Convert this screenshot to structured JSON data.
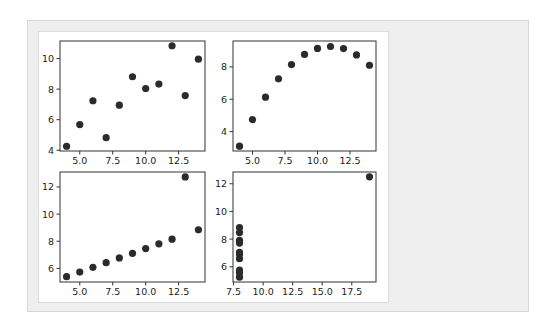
{
  "figure": {
    "layout": "2x2 grid of scatter plots",
    "marker_color": "#2b2b2b",
    "frame_color": "#333333",
    "panel_bg": "#efefef"
  },
  "chart_data": [
    {
      "type": "scatter",
      "title": "",
      "xlabel": "",
      "ylabel": "",
      "x": [
        10,
        8,
        13,
        9,
        11,
        14,
        6,
        4,
        12,
        7,
        5
      ],
      "y": [
        8.04,
        6.95,
        7.58,
        8.81,
        8.33,
        9.96,
        7.24,
        4.26,
        10.84,
        4.82,
        5.68
      ],
      "xlim": [
        3.5,
        14.5
      ],
      "ylim": [
        3.95,
        11.15
      ],
      "xticks": [
        5.0,
        7.5,
        10.0,
        12.5
      ],
      "xtick_labels": [
        "5.0",
        "7.5",
        "10.0",
        "12.5"
      ],
      "yticks": [
        4,
        6,
        8,
        10
      ],
      "ytick_labels": [
        "4",
        "6",
        "8",
        "10"
      ],
      "grid": false,
      "box": {
        "left": 60,
        "top": 41,
        "right": 205,
        "bottom": 151
      }
    },
    {
      "type": "scatter",
      "title": "",
      "xlabel": "",
      "ylabel": "",
      "x": [
        10,
        8,
        13,
        9,
        11,
        14,
        6,
        4,
        12,
        7,
        5
      ],
      "y": [
        9.14,
        8.14,
        8.74,
        8.77,
        9.26,
        8.1,
        6.13,
        3.1,
        9.13,
        7.26,
        4.74
      ],
      "xlim": [
        3.5,
        14.5
      ],
      "ylim": [
        2.8,
        9.6
      ],
      "xticks": [
        5.0,
        7.5,
        10.0,
        12.5
      ],
      "xtick_labels": [
        "5.0",
        "7.5",
        "10.0",
        "12.5"
      ],
      "yticks": [
        4,
        6,
        8
      ],
      "ytick_labels": [
        "4",
        "6",
        "8"
      ],
      "grid": false,
      "box": {
        "left": 233,
        "top": 41,
        "right": 376,
        "bottom": 151
      }
    },
    {
      "type": "scatter",
      "title": "",
      "xlabel": "",
      "ylabel": "",
      "x": [
        10,
        8,
        13,
        9,
        11,
        14,
        6,
        4,
        12,
        7,
        5
      ],
      "y": [
        7.46,
        6.77,
        12.74,
        7.11,
        7.81,
        8.84,
        6.08,
        5.39,
        8.15,
        6.42,
        5.73
      ],
      "xlim": [
        3.5,
        14.5
      ],
      "ylim": [
        5.0,
        13.1
      ],
      "xticks": [
        5.0,
        7.5,
        10.0,
        12.5
      ],
      "xtick_labels": [
        "5.0",
        "7.5",
        "10.0",
        "12.5"
      ],
      "yticks": [
        6,
        8,
        10,
        12
      ],
      "ytick_labels": [
        "6",
        "8",
        "10",
        "12"
      ],
      "grid": false,
      "box": {
        "left": 60,
        "top": 172,
        "right": 205,
        "bottom": 282
      }
    },
    {
      "type": "scatter",
      "title": "",
      "xlabel": "",
      "ylabel": "",
      "x": [
        8,
        8,
        8,
        8,
        8,
        8,
        8,
        19,
        8,
        8,
        8
      ],
      "y": [
        6.58,
        5.76,
        7.71,
        8.84,
        8.47,
        7.04,
        5.25,
        12.5,
        5.56,
        7.91,
        6.89
      ],
      "xlim": [
        7.45,
        19.55
      ],
      "ylim": [
        4.9,
        12.85
      ],
      "xticks": [
        7.5,
        10.0,
        12.5,
        15.0,
        17.5
      ],
      "xtick_labels": [
        "7.5",
        "10.0",
        "12.5",
        "15.0",
        "17.5"
      ],
      "yticks": [
        6,
        8,
        10,
        12
      ],
      "ytick_labels": [
        "6",
        "8",
        "10",
        "12"
      ],
      "grid": false,
      "box": {
        "left": 233,
        "top": 172,
        "right": 376,
        "bottom": 282
      }
    }
  ]
}
